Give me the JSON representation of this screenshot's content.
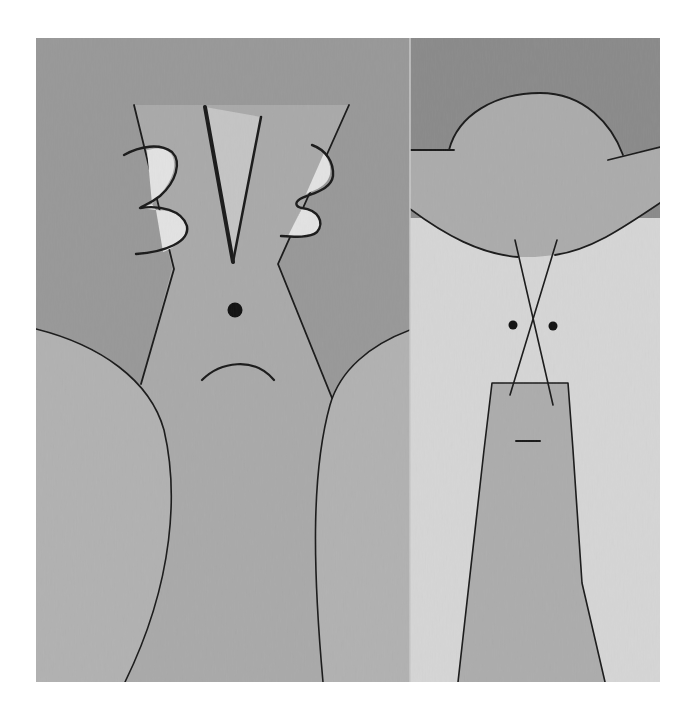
{
  "artwork": {
    "type": "abstract two-panel painting (diptych), grayscale",
    "background": "#ffffff",
    "frame": {
      "x": 36,
      "y": 38,
      "width": 624,
      "height": 644
    },
    "palette": {
      "left_sky": "#989898",
      "left_trunk": "#a9a9a9",
      "left_shoulder": "#b1b1b1",
      "v_fill": "#c2c2c2",
      "three_fill": "#e2e2e2",
      "right_sky": "#8a8a8a",
      "right_hat": "#ababab",
      "right_light": "#d5d5d5",
      "right_column": "#acacac",
      "ink": "#1a1a1a"
    },
    "panels": [
      {
        "name": "left-panel",
        "figure": "face with V, two '3'-like squiggles, single dot eye and frown"
      },
      {
        "name": "right-panel",
        "figure": "hat-shaped dome, crossed lines, two dot eyes, column with dash"
      }
    ]
  }
}
